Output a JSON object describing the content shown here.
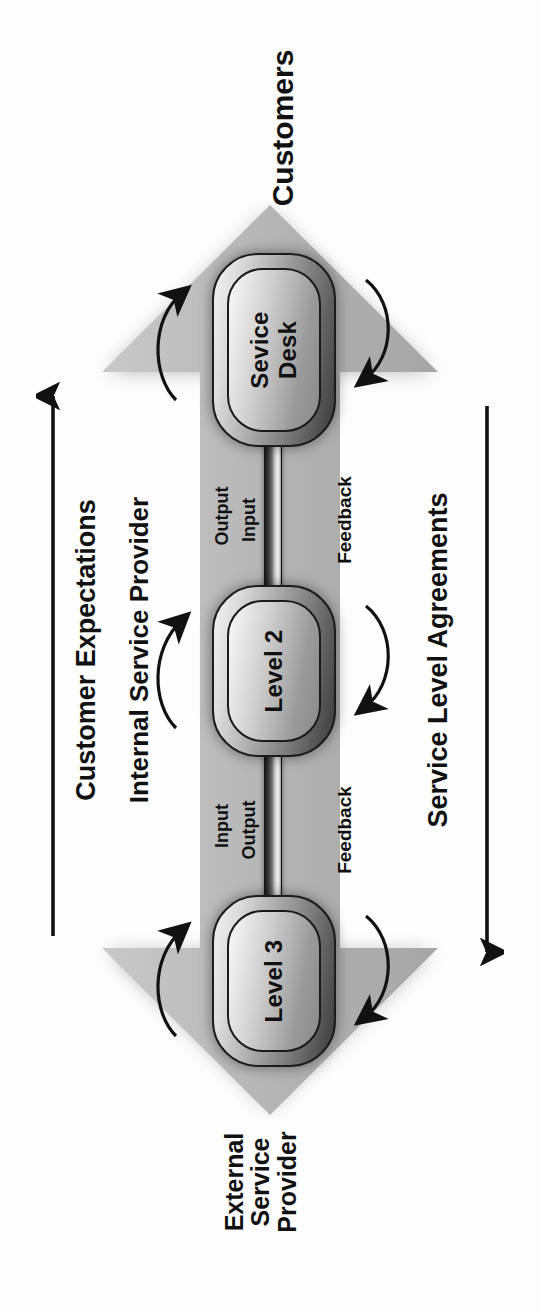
{
  "diagram": {
    "orientation": "rotated-90",
    "background_color": "#fdfdfd",
    "arrow_fill": "#b6b6b6",
    "text_color": "#111111"
  },
  "endpoints": {
    "top_label": "Customers",
    "bottom_label_lines": [
      "External",
      "Service",
      "Provider"
    ]
  },
  "band_label": "Internal Service Provider",
  "side_arrows": [
    {
      "name": "customer-expectations",
      "label": "Customer Expectations",
      "direction": "up-toward-customers"
    },
    {
      "name": "service-level-agreements",
      "label": "Service Level Agreements",
      "direction": "down-toward-external-provider"
    }
  ],
  "nodes": [
    {
      "id": "service-desk",
      "label": "Sevice Desk",
      "label_lines": [
        "Sevice",
        "Desk"
      ]
    },
    {
      "id": "level-2",
      "label": "Level 2",
      "label_lines": [
        "Level 2"
      ]
    },
    {
      "id": "level-3",
      "label": "Level 3",
      "label_lines": [
        "Level 3"
      ]
    }
  ],
  "flow_labels": [
    {
      "id": "sd-l2-output",
      "text": "Output"
    },
    {
      "id": "sd-l2-input",
      "text": "Input"
    },
    {
      "id": "l2-l3-input",
      "text": "Input"
    },
    {
      "id": "l2-l3-output",
      "text": "Output"
    }
  ],
  "feedback_labels": [
    {
      "id": "feedback-sd-l2",
      "text": "Feedback"
    },
    {
      "id": "feedback-l2-l3",
      "text": "Feedback"
    }
  ]
}
